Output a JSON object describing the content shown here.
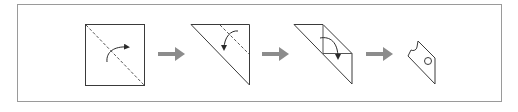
{
  "diagram": {
    "type": "paper-folding-sequence",
    "frame": {
      "x": 17,
      "y": 4,
      "width": 485,
      "height": 98,
      "stroke": "#9a9a9a"
    },
    "colors": {
      "line": "#3a3a3a",
      "dashed": "#555555",
      "arrow": "#8c8c8c",
      "background": "#ffffff"
    },
    "steps": [
      {
        "id": 1,
        "description": "Square sheet with dashed diagonal fold line and curved fold arrow"
      },
      {
        "id": 2,
        "description": "Folded triangle with dashed fold line and curved downward fold arrow"
      },
      {
        "id": 3,
        "description": "Further folded shape with fold lines and curved fold arrow"
      },
      {
        "id": 4,
        "description": "Folded piece with semicircular notch cut and circular hole punched"
      }
    ],
    "transitions": [
      {
        "from": 1,
        "to": 2,
        "icon": "right-arrow"
      },
      {
        "from": 2,
        "to": 3,
        "icon": "right-arrow"
      },
      {
        "from": 3,
        "to": 4,
        "icon": "right-arrow"
      }
    ]
  }
}
